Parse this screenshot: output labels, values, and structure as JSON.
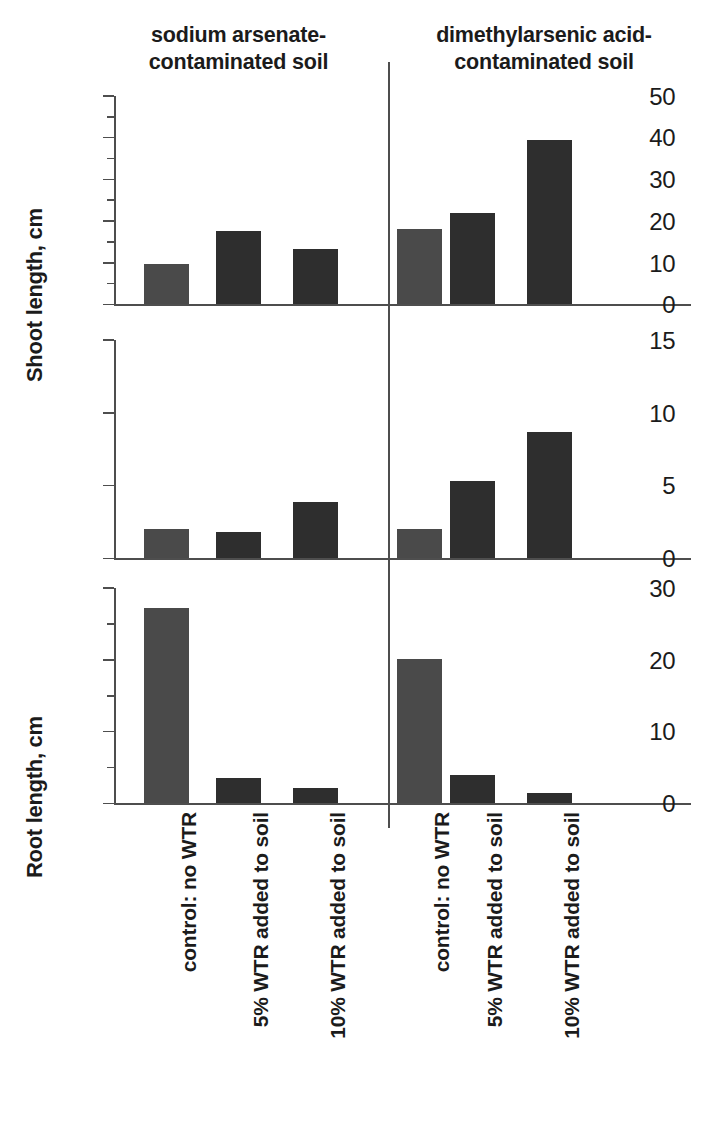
{
  "groups": [
    {
      "id": "sodium-arsenate",
      "line1": "sodium arsenate-",
      "line2": "contaminated soil"
    },
    {
      "id": "dimethylarsenic-acid",
      "line1": "dimethylarsenic acid-",
      "line2": "contaminated soil"
    }
  ],
  "categories": [
    "control: no WTR",
    "5% WTR added to soil",
    "10% WTR added to soil",
    "control: no WTR",
    "5% WTR added to soil",
    "10% WTR added to soil"
  ],
  "colors": {
    "bar_light": "#4a4a4a",
    "bar_dark": "#2e2e2e",
    "axis": "#4e4e4e",
    "text": "#1b1b1b",
    "background": "#ffffff"
  },
  "chart_data": [
    {
      "id": "shoot-length",
      "type": "bar",
      "title": "",
      "ylabel": "Shoot length, cm",
      "xlabel": "",
      "ylim": [
        0,
        50
      ],
      "yticks": [
        0,
        10,
        20,
        30,
        40,
        50
      ],
      "yticklabels": [
        "0",
        "10",
        "20",
        "30",
        "40",
        "50"
      ],
      "yminorticks": [
        5,
        15,
        25,
        35,
        45
      ],
      "grid": false,
      "legend": "none",
      "categories": [
        "control: no WTR",
        "5% WTR added to soil",
        "10% WTR added to soil",
        "control: no WTR",
        "5% WTR added to soil",
        "10% WTR added to soil"
      ],
      "groups": [
        "sodium arsenate-contaminated soil",
        "sodium arsenate-contaminated soil",
        "sodium arsenate-contaminated soil",
        "dimethylarsenic acid-contaminated soil",
        "dimethylarsenic acid-contaminated soil",
        "dimethylarsenic acid-contaminated soil"
      ],
      "values": [
        9.7,
        17.5,
        13.3,
        18.2,
        22.0,
        39.5
      ],
      "bar_shades": [
        "light",
        "dark",
        "dark",
        "light",
        "dark",
        "dark"
      ]
    },
    {
      "id": "root-length",
      "type": "bar",
      "title": "",
      "ylabel": "Root length, cm",
      "xlabel": "",
      "ylim": [
        0,
        15
      ],
      "yticks": [
        0,
        5,
        10,
        15
      ],
      "yticklabels": [
        "0",
        "5",
        "10",
        "15"
      ],
      "yminorticks": [],
      "grid": false,
      "legend": "none",
      "categories": [
        "control: no WTR",
        "5% WTR added to soil",
        "10% WTR added to soil",
        "control: no WTR",
        "5% WTR added to soil",
        "10% WTR added to soil"
      ],
      "groups": [
        "sodium arsenate-contaminated soil",
        "sodium arsenate-contaminated soil",
        "sodium arsenate-contaminated soil",
        "dimethylarsenic acid-contaminated soil",
        "dimethylarsenic acid-contaminated soil",
        "dimethylarsenic acid-contaminated soil"
      ],
      "values": [
        2.0,
        1.8,
        3.9,
        2.0,
        5.3,
        8.7
      ],
      "bar_shades": [
        "light",
        "dark",
        "dark",
        "light",
        "dark",
        "dark"
      ]
    },
    {
      "id": "total-as-in-plant",
      "type": "bar",
      "title": "",
      "ylabel": "Total As in plant, ppm",
      "xlabel": "",
      "ylim": [
        0,
        30
      ],
      "yticks": [
        0,
        10,
        20,
        30
      ],
      "yticklabels": [
        "0",
        "10",
        "20",
        "30"
      ],
      "yminorticks": [
        5,
        15,
        25
      ],
      "grid": false,
      "legend": "none",
      "categories": [
        "control: no WTR",
        "5% WTR added to soil",
        "10% WTR added to soil",
        "control: no WTR",
        "5% WTR added to soil",
        "10% WTR added to soil"
      ],
      "groups": [
        "sodium arsenate-contaminated soil",
        "sodium arsenate-contaminated soil",
        "sodium arsenate-contaminated soil",
        "dimethylarsenic acid-contaminated soil",
        "dimethylarsenic acid-contaminated soil",
        "dimethylarsenic acid-contaminated soil"
      ],
      "values": [
        27.2,
        3.5,
        2.1,
        20.1,
        4.0,
        1.5
      ],
      "bar_shades": [
        "light",
        "dark",
        "dark",
        "light",
        "dark",
        "dark"
      ]
    }
  ]
}
